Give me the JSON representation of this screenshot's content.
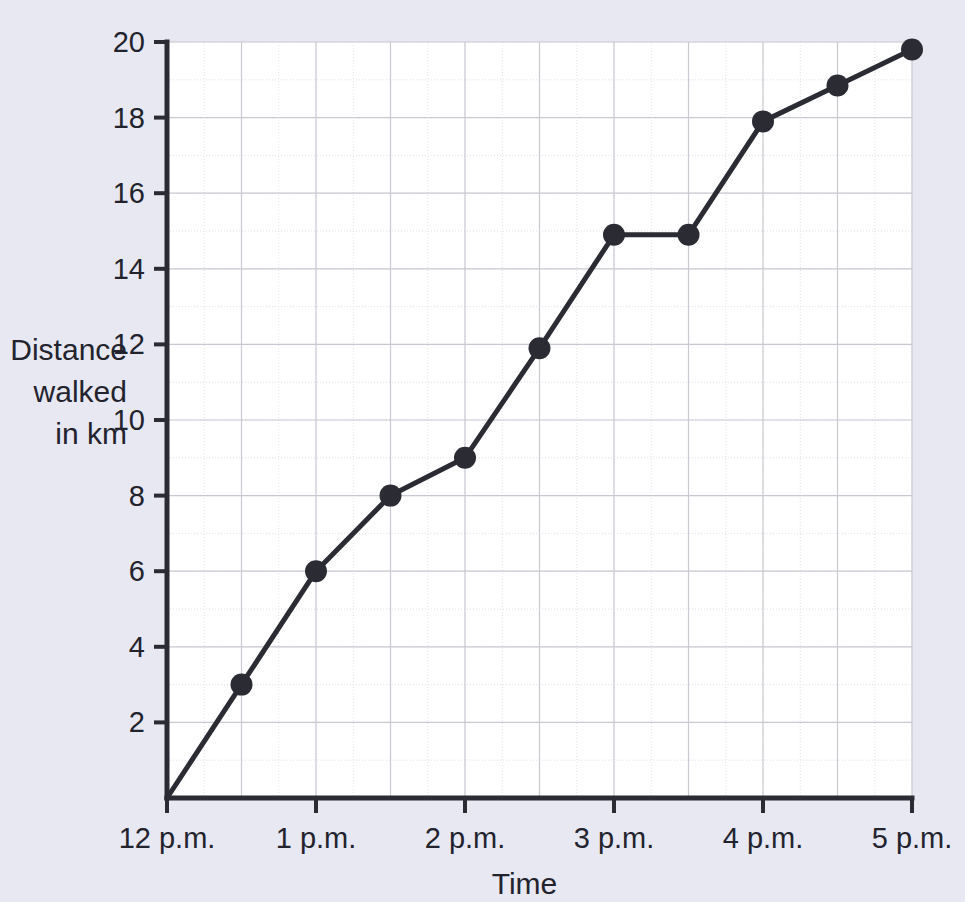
{
  "chart_data": {
    "type": "line",
    "title": "",
    "xlabel": "Time",
    "ylabel": "Distance walked in km",
    "ylabel_lines": [
      "Distance",
      "walked",
      "in km"
    ],
    "x_tick_labels": [
      "12 p.m.",
      "1 p.m.",
      "2 p.m.",
      "3 p.m.",
      "4 p.m.",
      "5 p.m."
    ],
    "x_tick_values": [
      12,
      13,
      14,
      15,
      16,
      17
    ],
    "y_tick_labels": [
      "0",
      "2",
      "4",
      "6",
      "8",
      "10",
      "12",
      "14",
      "16",
      "18",
      "20"
    ],
    "y_tick_values": [
      0,
      2,
      4,
      6,
      8,
      10,
      12,
      14,
      16,
      18,
      20
    ],
    "xlim": [
      12,
      17
    ],
    "ylim": [
      0,
      20
    ],
    "grid": true,
    "grid_major_x_step": 0.5,
    "grid_minor_x_step": 0.25,
    "grid_major_y_step": 2,
    "grid_minor_y_step": 1,
    "legend": "none",
    "x": [
      12,
      12.5,
      13,
      13.5,
      14,
      14.5,
      15,
      15.5,
      16,
      16.5,
      17
    ],
    "x_point_labels": [
      "12 p.m.",
      "12:30 p.m.",
      "1 p.m.",
      "1:30 p.m.",
      "2 p.m.",
      "2:30 p.m.",
      "3 p.m.",
      "3:30 p.m.",
      "4 p.m.",
      "4:30 p.m.",
      "5 p.m."
    ],
    "values": [
      0,
      3,
      6,
      8,
      9,
      11.9,
      14.9,
      14.9,
      17.9,
      18.85,
      19.8
    ],
    "series": [
      {
        "name": "Distance walked",
        "values": [
          0,
          3,
          6,
          8,
          9,
          11.9,
          14.9,
          14.9,
          17.9,
          18.85,
          19.8
        ],
        "color": "#2b2b33",
        "marker": "circle",
        "marker_size": 11,
        "line_width": 5
      }
    ],
    "colors": {
      "page_background": "#e7e8f2",
      "plot_background": "#ffffff",
      "axis": "#2b2b33",
      "grid_major": "#c9c9d2",
      "grid_minor": "#e0e0e8",
      "line": "#2b2b33",
      "text": "#23232e"
    }
  }
}
